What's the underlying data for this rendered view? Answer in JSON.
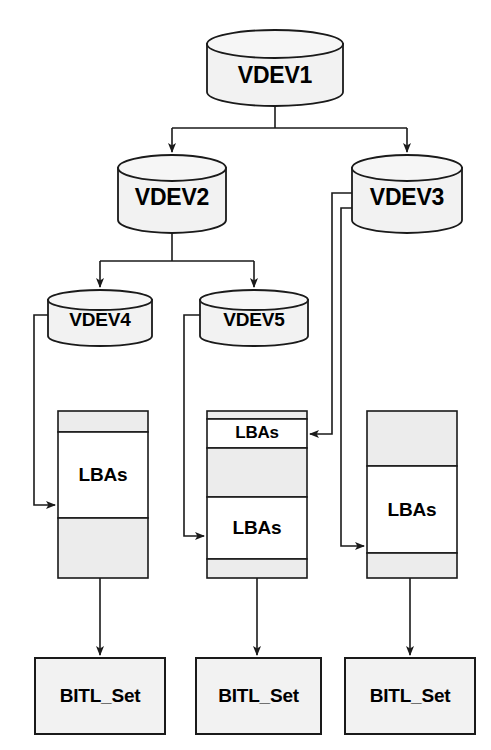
{
  "diagram": {
    "type": "tree-diagram",
    "colors": {
      "stroke": "#1a1a1a",
      "cylinder_fill": "#f2f2f2",
      "segment_gray": "#ececec",
      "segment_white": "#ffffff",
      "box_fill": "#f2f2f2",
      "background": "#ffffff",
      "text": "#000000"
    },
    "cylinders": [
      {
        "id": "vdev1",
        "label": "VDEV1",
        "x": 207,
        "y": 30,
        "w": 136,
        "h": 76,
        "rx": 14,
        "size": "big"
      },
      {
        "id": "vdev2",
        "label": "VDEV2",
        "x": 118,
        "y": 155,
        "w": 108,
        "h": 78,
        "rx": 12,
        "size": "big"
      },
      {
        "id": "vdev3",
        "label": "VDEV3",
        "x": 352,
        "y": 155,
        "w": 110,
        "h": 78,
        "rx": 12,
        "size": "big"
      },
      {
        "id": "vdev4",
        "label": "VDEV4",
        "x": 48,
        "y": 290,
        "w": 104,
        "h": 56,
        "rx": 10,
        "size": "small"
      },
      {
        "id": "vdev5",
        "label": "VDEV5",
        "x": 200,
        "y": 290,
        "w": 108,
        "h": 56,
        "rx": 10,
        "size": "small"
      }
    ],
    "columns": [
      {
        "id": "column-left",
        "x": 58,
        "y": 411,
        "w": 90,
        "h": 167,
        "segments": [
          {
            "fill": "gray",
            "h": 21,
            "label": ""
          },
          {
            "fill": "white",
            "h": 86,
            "label": "LBAs"
          },
          {
            "fill": "gray",
            "h": 60,
            "label": ""
          }
        ]
      },
      {
        "id": "column-middle",
        "x": 207,
        "y": 411,
        "w": 100,
        "h": 167,
        "segments": [
          {
            "fill": "gray",
            "h": 8,
            "label": ""
          },
          {
            "fill": "white",
            "h": 29,
            "label": "LBAs"
          },
          {
            "fill": "gray",
            "h": 49,
            "label": ""
          },
          {
            "fill": "white",
            "h": 62,
            "label": "LBAs"
          },
          {
            "fill": "gray",
            "h": 19,
            "label": ""
          }
        ]
      },
      {
        "id": "column-right",
        "x": 367,
        "y": 411,
        "w": 90,
        "h": 167,
        "segments": [
          {
            "fill": "gray",
            "h": 55,
            "label": ""
          },
          {
            "fill": "white",
            "h": 87,
            "label": "LBAs"
          },
          {
            "fill": "gray",
            "h": 25,
            "label": ""
          }
        ]
      }
    ],
    "boxes": [
      {
        "id": "bitl-left",
        "label": "BITL_Set",
        "x": 35,
        "y": 658,
        "w": 130,
        "h": 76
      },
      {
        "id": "bitl-middle",
        "label": "BITL_Set",
        "x": 196,
        "y": 658,
        "w": 125,
        "h": 76
      },
      {
        "id": "bitl-right",
        "label": "BITL_Set",
        "x": 345,
        "y": 658,
        "w": 130,
        "h": 76
      }
    ],
    "connectors": [
      {
        "id": "vdev1-to-vdev2",
        "from": "VDEV1",
        "to": "VDEV2",
        "arrow": true
      },
      {
        "id": "vdev1-to-vdev3",
        "from": "VDEV1",
        "to": "VDEV3",
        "arrow": true
      },
      {
        "id": "vdev2-to-vdev4",
        "from": "VDEV2",
        "to": "VDEV4",
        "arrow": true
      },
      {
        "id": "vdev2-to-vdev5",
        "from": "VDEV2",
        "to": "VDEV5",
        "arrow": true
      },
      {
        "id": "vdev4-to-column-left",
        "from": "VDEV4",
        "to": "column-left LBAs",
        "arrow": true
      },
      {
        "id": "vdev5-to-column-middle",
        "from": "VDEV5",
        "to": "column-middle lower LBAs",
        "arrow": true
      },
      {
        "id": "vdev3-to-column-middle-top",
        "from": "VDEV3",
        "to": "column-middle upper LBAs",
        "arrow": true
      },
      {
        "id": "vdev3-to-column-right",
        "from": "VDEV3",
        "to": "column-right LBAs",
        "arrow": true
      },
      {
        "id": "column-left-to-bitl",
        "from": "column-left",
        "to": "BITL_Set",
        "arrow": true
      },
      {
        "id": "column-middle-to-bitl",
        "from": "column-middle",
        "to": "BITL_Set",
        "arrow": true
      },
      {
        "id": "column-right-to-bitl",
        "from": "column-right",
        "to": "BITL_Set",
        "arrow": true
      }
    ]
  }
}
